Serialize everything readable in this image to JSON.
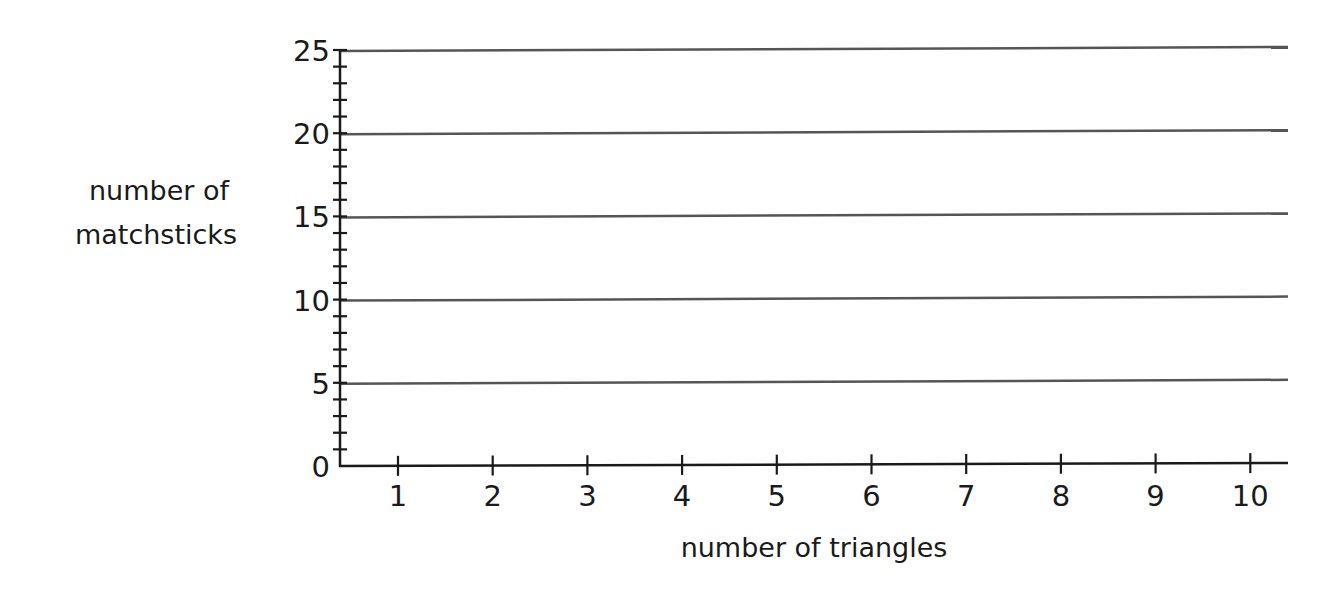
{
  "chart_data": {
    "type": "line",
    "title": "",
    "xlabel": "number of triangles",
    "ylabel": [
      "number of",
      "matchsticks"
    ],
    "x_ticks": [
      1,
      2,
      3,
      4,
      5,
      6,
      7,
      8,
      9,
      10
    ],
    "x_tick_labels": [
      "1",
      "2",
      "3",
      "4",
      "5",
      "6",
      "7",
      "8",
      "9",
      "10"
    ],
    "y_ticks": [
      0,
      5,
      10,
      15,
      20,
      25
    ],
    "y_tick_labels": [
      "0",
      "5",
      "10",
      "15",
      "20",
      "25"
    ],
    "y_minor_step": 1,
    "xlim": [
      0,
      10.4
    ],
    "ylim": [
      0,
      25
    ],
    "grid": "horizontal at major y ticks",
    "series": [],
    "legend": "none"
  }
}
